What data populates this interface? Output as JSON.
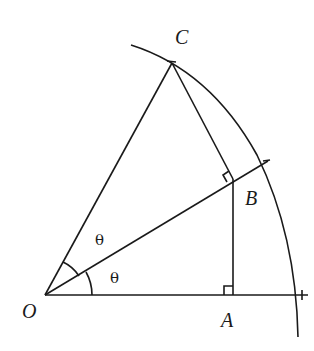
{
  "diagram": {
    "type": "geometry",
    "points": {
      "O": {
        "label": "O"
      },
      "A": {
        "label": "A"
      },
      "B": {
        "label": "B"
      },
      "C": {
        "label": "C"
      }
    },
    "angle_labels": [
      "θ",
      "θ"
    ],
    "right_angles": [
      "at B (angle OBC)",
      "at A (angle OAB)"
    ]
  }
}
